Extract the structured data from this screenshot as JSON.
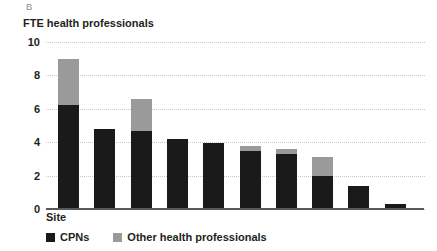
{
  "panel": {
    "letter": "B"
  },
  "axes": {
    "y_title": "FTE health professionals",
    "x_title": "Site",
    "y_ticks": [
      "10",
      "8",
      "6",
      "4",
      "2",
      "0"
    ]
  },
  "legend": {
    "items": [
      {
        "label": "CPNs",
        "color": "#1a1a1a",
        "swatch_name": "legend-swatch-cpns"
      },
      {
        "label": "Other health professionals",
        "color": "#9a9a9a",
        "swatch_name": "legend-swatch-other"
      }
    ]
  },
  "chart_data": {
    "type": "bar",
    "stacked": true,
    "title": "",
    "subtitle": "",
    "panel_label": "B",
    "xlabel": "Site",
    "ylabel": "FTE health professionals",
    "ylim": [
      0,
      10
    ],
    "yticks": [
      0,
      2,
      4,
      6,
      8,
      10
    ],
    "grid": "horizontal-dotted",
    "legend_position": "bottom-left",
    "categories": [
      "1",
      "2",
      "3",
      "4",
      "5",
      "6",
      "7",
      "8",
      "9",
      "10"
    ],
    "series": [
      {
        "name": "CPNs",
        "color": "#1a1a1a",
        "values": [
          6.2,
          4.8,
          4.65,
          4.2,
          3.95,
          3.5,
          3.3,
          2.0,
          1.35,
          0.3
        ]
      },
      {
        "name": "Other health professionals",
        "color": "#9a9a9a",
        "values": [
          2.8,
          0.0,
          1.95,
          0.0,
          0.0,
          0.3,
          0.3,
          1.1,
          0.0,
          0.0
        ]
      }
    ],
    "totals": [
      9.0,
      4.8,
      6.6,
      4.2,
      3.95,
      3.8,
      3.6,
      3.1,
      1.35,
      0.3
    ]
  }
}
